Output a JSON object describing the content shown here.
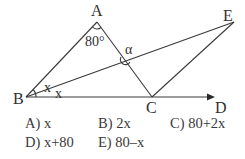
{
  "figure": {
    "points": {
      "A": {
        "label": "A",
        "x": 97,
        "y": 22
      },
      "B": {
        "label": "B",
        "x": 26,
        "y": 97
      },
      "C": {
        "label": "C",
        "x": 152,
        "y": 97
      },
      "D": {
        "label": "D",
        "x": 215,
        "y": 97
      },
      "E": {
        "label": "E",
        "x": 234,
        "y": 22
      }
    },
    "segments": [
      "AB",
      "AC",
      "BE",
      "CE",
      "BD (ray)"
    ],
    "angles": {
      "A": "80°",
      "ABE": "x",
      "EBC": "x",
      "intersection": "α"
    },
    "line_color": "#3a3a3a"
  },
  "options": [
    {
      "key": "A)",
      "text": "x"
    },
    {
      "key": "B)",
      "text": "2x"
    },
    {
      "key": "C)",
      "text": "80+2x"
    },
    {
      "key": "D)",
      "text": "x+80"
    },
    {
      "key": "E)",
      "text": "80–x"
    }
  ],
  "labels": {
    "A": "A",
    "B": "B",
    "C": "C",
    "D": "D",
    "E": "E",
    "angle_a": "80°",
    "x1": "x",
    "x2": "x",
    "alpha": "α"
  }
}
